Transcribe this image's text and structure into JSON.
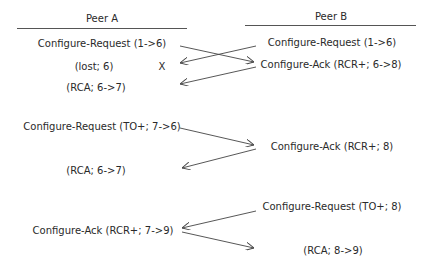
{
  "peers": {
    "a": {
      "label": "Peer A"
    },
    "b": {
      "label": "Peer B"
    }
  },
  "left": [
    {
      "text": "Configure-Request (1->6)",
      "x": 102,
      "y": 38
    },
    {
      "text": "(lost; 6)",
      "x": 94,
      "y": 61
    },
    {
      "text": "X",
      "x": 162,
      "y": 61
    },
    {
      "text": "(RCA; 6->7)",
      "x": 96,
      "y": 82
    },
    {
      "text": "Configure-Request (TO+; 7->6)",
      "x": 102,
      "y": 121
    },
    {
      "text": "(RCA; 6->7)",
      "x": 96,
      "y": 165
    },
    {
      "text": "Configure-Ack (RCR+; 7->9)",
      "x": 103,
      "y": 225
    }
  ],
  "right": [
    {
      "text": "Configure-Request (1->6)",
      "x": 332,
      "y": 37
    },
    {
      "text": "Configure-Ack (RCR+; 6->8)",
      "x": 331,
      "y": 59
    },
    {
      "text": "Configure-Ack (RCR+; 8)",
      "x": 332,
      "y": 141
    },
    {
      "text": "Configure-Request (TO+; 8)",
      "x": 332,
      "y": 201
    },
    {
      "text": "(RCA; 8->9)",
      "x": 333,
      "y": 245
    }
  ],
  "arrows": [
    {
      "from": [
        180,
        46
      ],
      "to": [
        254,
        62
      ],
      "direction": "A->B"
    },
    {
      "from": [
        256,
        46
      ],
      "to": [
        180,
        63
      ],
      "direction": "B->A"
    },
    {
      "from": [
        256,
        67
      ],
      "to": [
        180,
        84
      ],
      "direction": "B->A"
    },
    {
      "from": [
        180,
        128
      ],
      "to": [
        254,
        145
      ],
      "direction": "A->B"
    },
    {
      "from": [
        256,
        149
      ],
      "to": [
        182,
        168
      ],
      "direction": "B->A"
    },
    {
      "from": [
        256,
        211
      ],
      "to": [
        182,
        228
      ],
      "direction": "B->A"
    },
    {
      "from": [
        182,
        232
      ],
      "to": [
        254,
        248
      ],
      "direction": "A->B"
    }
  ]
}
